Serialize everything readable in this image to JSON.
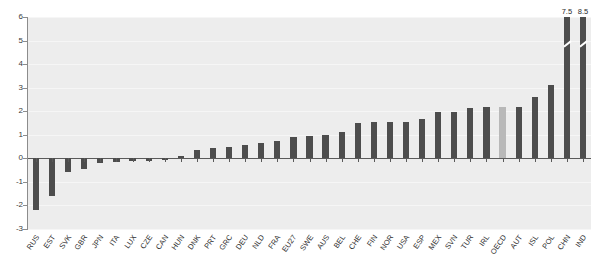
{
  "chart_data": {
    "type": "bar",
    "title": "",
    "xlabel": "",
    "ylabel": "",
    "ylim": [
      -3,
      6
    ],
    "grid": true,
    "legend": "none",
    "yticks": [
      6,
      5,
      4,
      3,
      2,
      1,
      0,
      -1,
      -2,
      -3
    ],
    "ytick_labels": [
      "6",
      "5",
      "4",
      "3",
      "2",
      "1",
      "0",
      "-1",
      "-2",
      "-3"
    ],
    "highlight_category": "OECD",
    "highlight_color": "#b8b8b8",
    "bar_color": "#4d4d4d",
    "plot_background": "#ededed",
    "categories": [
      "RUS",
      "EST",
      "SVK",
      "GBR",
      "JPN",
      "ITA",
      "LUX",
      "CZE",
      "CAN",
      "HUN",
      "DNK",
      "PRT",
      "GRC",
      "DEU",
      "NLD",
      "FRA",
      "EU27",
      "SWE",
      "AUS",
      "BEL",
      "CHE",
      "FIN",
      "NOR",
      "USA",
      "ESP",
      "MEX",
      "SVN",
      "TUR",
      "IRL",
      "OECD",
      "AUT",
      "ISL",
      "POL",
      "CHN",
      "IND"
    ],
    "values": [
      -2.2,
      -1.6,
      -0.6,
      -0.45,
      -0.2,
      -0.15,
      -0.1,
      -0.1,
      -0.05,
      0.1,
      0.35,
      0.45,
      0.5,
      0.55,
      0.65,
      0.75,
      0.9,
      0.95,
      1.0,
      1.1,
      1.5,
      1.55,
      1.55,
      1.55,
      1.65,
      1.95,
      1.95,
      2.15,
      2.2,
      2.2,
      2.2,
      2.6,
      3.1,
      7.5,
      8.5
    ],
    "broken_bars": [
      {
        "category": "CHN",
        "label": "7.5"
      },
      {
        "category": "IND",
        "label": "8.5"
      }
    ],
    "axis_color": "#8c8c8c",
    "zero_line_color": "#5a5a5a"
  },
  "header": {
    "cropped_text": "·   ·      ·      ·                ·"
  }
}
